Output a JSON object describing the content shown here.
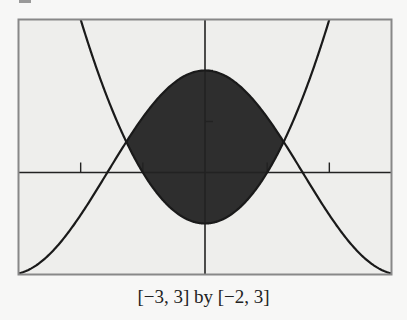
{
  "chart_data": {
    "type": "line",
    "title": "",
    "caption": "[−3, 3] by [−2, 3]",
    "xlabel": "",
    "ylabel": "",
    "xlim": [
      -3,
      3
    ],
    "ylim": [
      -2,
      3
    ],
    "x_ticks": [
      -2,
      -1,
      1,
      2
    ],
    "y_ticks": [
      1,
      2
    ],
    "grid": false,
    "series": [
      {
        "name": "y = 2cos(x)",
        "fn": "2cos",
        "color": "#1a1a1a"
      },
      {
        "name": "y = x^2 - 1",
        "fn": "x2m1",
        "color": "#1a1a1a"
      }
    ],
    "shaded_region": {
      "between": [
        "y = 2cos(x)",
        "y = x^2 - 1"
      ],
      "x_range": [
        -1.25,
        1.25
      ],
      "color": "#2e2e2e"
    },
    "sample_points": {
      "y = 2cos(x)": [
        [
          -3,
          -1.98
        ],
        [
          -2,
          -0.83
        ],
        [
          -1.57,
          0
        ],
        [
          -1,
          1.08
        ],
        [
          0,
          2
        ],
        [
          1,
          1.08
        ],
        [
          1.57,
          0
        ],
        [
          2,
          -0.83
        ],
        [
          3,
          -1.98
        ]
      ],
      "y = x^2 - 1": [
        [
          -2,
          3
        ],
        [
          -1.25,
          0.56
        ],
        [
          -1,
          0
        ],
        [
          0,
          -1
        ],
        [
          1,
          0
        ],
        [
          1.25,
          0.56
        ],
        [
          2,
          3
        ]
      ]
    }
  },
  "colors": {
    "background": "#eeeeec",
    "frame": "#888888",
    "axis": "#222222",
    "shade": "#2e2e2e",
    "curve": "#1a1a1a"
  }
}
